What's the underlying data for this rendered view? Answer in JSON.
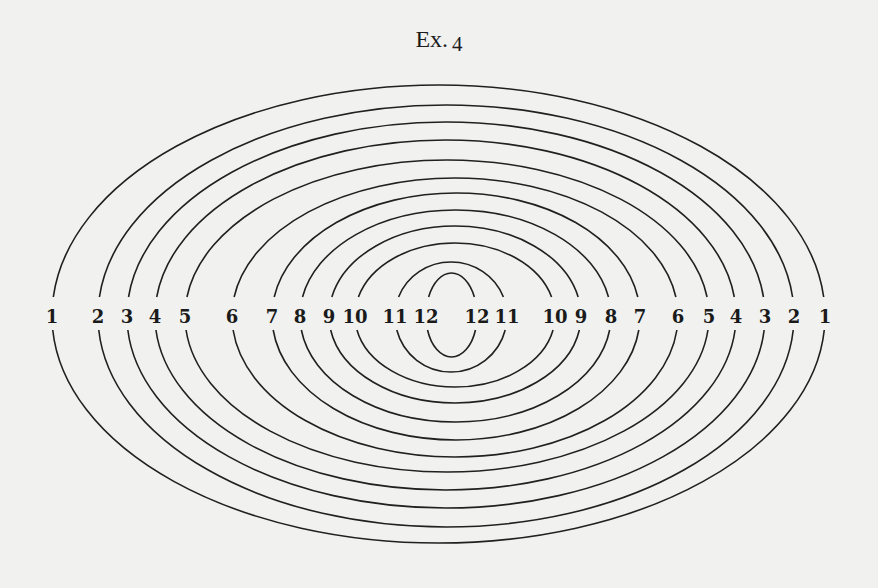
{
  "figure": {
    "title_prefix": "Ex.",
    "title_number": "4",
    "label_row_y": 316,
    "center_x": 452,
    "left_labels": [
      {
        "text": "1",
        "x": 52
      },
      {
        "text": "2",
        "x": 98
      },
      {
        "text": "3",
        "x": 127
      },
      {
        "text": "4",
        "x": 155
      },
      {
        "text": "5",
        "x": 185
      },
      {
        "text": "6",
        "x": 232
      },
      {
        "text": "7",
        "x": 272
      },
      {
        "text": "8",
        "x": 300
      },
      {
        "text": "9",
        "x": 329
      },
      {
        "text": "10",
        "x": 355
      },
      {
        "text": "11",
        "x": 395
      },
      {
        "text": "12",
        "x": 426
      }
    ],
    "right_labels": [
      {
        "text": "12",
        "x": 477
      },
      {
        "text": "11",
        "x": 507
      },
      {
        "text": "10",
        "x": 555
      },
      {
        "text": "9",
        "x": 581
      },
      {
        "text": "8",
        "x": 611
      },
      {
        "text": "7",
        "x": 640
      },
      {
        "text": "6",
        "x": 678
      },
      {
        "text": "5",
        "x": 709
      },
      {
        "text": "4",
        "x": 736
      },
      {
        "text": "3",
        "x": 765
      },
      {
        "text": "2",
        "x": 794
      },
      {
        "text": "1",
        "x": 825
      }
    ],
    "arcs": [
      {
        "id": 1,
        "x_left": 52,
        "x_right": 825,
        "top_y": 85,
        "bottom_y": 543
      },
      {
        "id": 2,
        "x_left": 98,
        "x_right": 794,
        "top_y": 105,
        "bottom_y": 527
      },
      {
        "id": 3,
        "x_left": 127,
        "x_right": 765,
        "top_y": 122,
        "bottom_y": 508
      },
      {
        "id": 4,
        "x_left": 155,
        "x_right": 736,
        "top_y": 140,
        "bottom_y": 490
      },
      {
        "id": 5,
        "x_left": 185,
        "x_right": 709,
        "top_y": 160,
        "bottom_y": 472
      },
      {
        "id": 6,
        "x_left": 232,
        "x_right": 678,
        "top_y": 178,
        "bottom_y": 457
      },
      {
        "id": 7,
        "x_left": 272,
        "x_right": 640,
        "top_y": 193,
        "bottom_y": 440
      },
      {
        "id": 8,
        "x_left": 300,
        "x_right": 611,
        "top_y": 210,
        "bottom_y": 422
      },
      {
        "id": 9,
        "x_left": 329,
        "x_right": 581,
        "top_y": 226,
        "bottom_y": 403
      },
      {
        "id": 10,
        "x_left": 355,
        "x_right": 555,
        "top_y": 243,
        "bottom_y": 387
      },
      {
        "id": 11,
        "x_left": 395,
        "x_right": 507,
        "top_y": 262,
        "bottom_y": 372
      },
      {
        "id": 12,
        "x_left": 426,
        "x_right": 477,
        "top_y": 273,
        "bottom_y": 357
      }
    ],
    "stroke_color": "#202020",
    "background_color": "#f1f1ef"
  }
}
